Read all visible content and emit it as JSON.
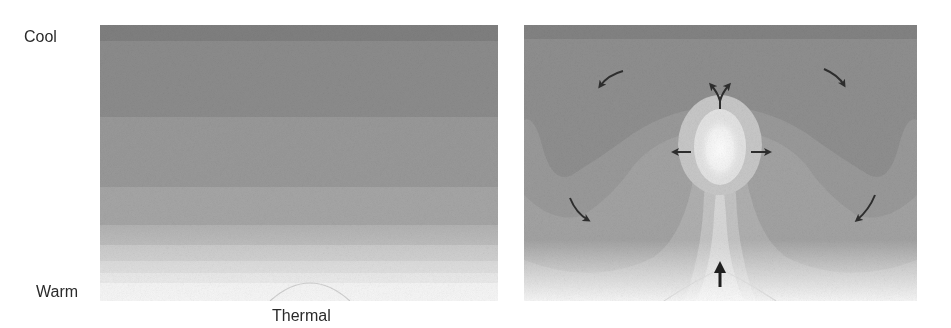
{
  "labels": {
    "top": "Cool",
    "bottom": "Warm",
    "caption": "Thermal"
  },
  "colors": {
    "background": "#ffffff",
    "text": "#2a2a2a",
    "arrow": "#2e2e2e",
    "band_darkest": "#7d7d7d",
    "band_lightest": "#f2f2f2",
    "plume_core": "#ffffff"
  },
  "panels": [
    {
      "id": "stratified",
      "description": "Horizontally layered temperature bands, cool (dark) at top to warm (light) at bottom",
      "bands": [
        {
          "from": 0,
          "to": 16,
          "color": "#808080"
        },
        {
          "from": 16,
          "to": 92,
          "color": "#8c8c8c"
        },
        {
          "from": 92,
          "to": 162,
          "color": "#999999"
        },
        {
          "from": 162,
          "to": 200,
          "color": "#a6a6a6"
        },
        {
          "from": 200,
          "to": 220,
          "color": "#b3b3b3"
        },
        {
          "from": 220,
          "to": 236,
          "color": "#c2c2c2"
        },
        {
          "from": 236,
          "to": 248,
          "color": "#d0d0d0"
        },
        {
          "from": 248,
          "to": 258,
          "color": "#dedede"
        },
        {
          "from": 258,
          "to": 276,
          "color": "#eeeeee"
        }
      ],
      "bump": {
        "center_x": 210,
        "width": 70,
        "height": 16
      }
    },
    {
      "id": "convection",
      "description": "Rising thermal plume with mushroom-shaped isotherms and circulation arrows",
      "arrows": [
        {
          "name": "upflow-arrow",
          "direction": "up"
        },
        {
          "name": "spread-left-arrow",
          "direction": "left"
        },
        {
          "name": "spread-right-arrow",
          "direction": "right"
        },
        {
          "name": "fork-left-arrow",
          "direction": "up-left"
        },
        {
          "name": "fork-right-arrow",
          "direction": "up-right"
        },
        {
          "name": "top-left-curve-arrow",
          "direction": "down-left"
        },
        {
          "name": "top-right-curve-arrow",
          "direction": "down-right"
        },
        {
          "name": "bottom-left-curve-arrow",
          "direction": "down-right"
        },
        {
          "name": "bottom-right-curve-arrow",
          "direction": "down-left"
        }
      ]
    }
  ]
}
